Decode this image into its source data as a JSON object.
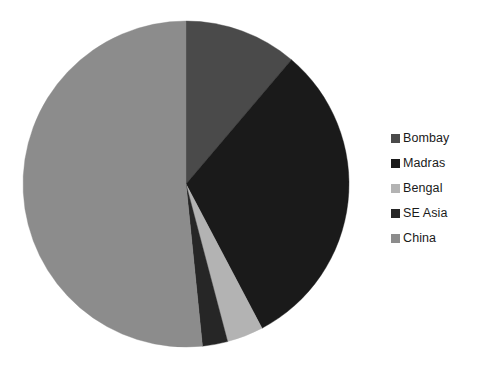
{
  "chart_data": {
    "type": "pie",
    "title": "",
    "categories": [
      "Bombay",
      "Madras",
      "Bengal",
      "SE Asia",
      "China"
    ],
    "values": [
      11.2,
      31.1,
      3.6,
      2.5,
      51.6
    ],
    "units": "percent",
    "start_angle_deg": 0,
    "direction": "clockwise",
    "legend_position": "right",
    "grid": false,
    "labels_shown": false,
    "colors": [
      "#4a4a4a",
      "#1a1a1a",
      "#b3b3b3",
      "#262626",
      "#8c8c8c"
    ],
    "slices": [
      {
        "name": "Bombay",
        "value": 11.2,
        "color": "#4a4a4a",
        "start_deg": 0.0,
        "end_deg": 40.3
      },
      {
        "name": "Madras",
        "value": 31.1,
        "color": "#1a1a1a",
        "start_deg": 40.3,
        "end_deg": 152.2
      },
      {
        "name": "Bengal",
        "value": 3.6,
        "color": "#b3b3b3",
        "start_deg": 152.2,
        "end_deg": 165.2
      },
      {
        "name": "SE Asia",
        "value": 2.5,
        "color": "#262626",
        "start_deg": 165.2,
        "end_deg": 174.2
      },
      {
        "name": "China",
        "value": 51.6,
        "color": "#8c8c8c",
        "start_deg": 174.2,
        "end_deg": 360.0
      }
    ]
  },
  "geometry": {
    "center_x": 186,
    "center_y": 184,
    "radius": 163
  },
  "legend": {
    "items": [
      {
        "label": "Bombay",
        "color": "#4a4a4a"
      },
      {
        "label": "Madras",
        "color": "#1a1a1a"
      },
      {
        "label": "Bengal",
        "color": "#b3b3b3"
      },
      {
        "label": "SE Asia",
        "color": "#262626"
      },
      {
        "label": "China",
        "color": "#8c8c8c"
      }
    ]
  }
}
